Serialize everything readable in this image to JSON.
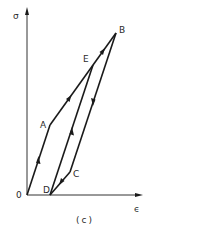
{
  "diagram": {
    "type": "stress-strain hysteresis loop",
    "caption": "(c)",
    "axes": {
      "y_label": "σ",
      "x_label": "ϵ",
      "origin_label": "0"
    },
    "points": [
      {
        "id": "O",
        "label": "0",
        "x": 27,
        "y": 195
      },
      {
        "id": "A",
        "label": "A",
        "x": 50,
        "y": 125
      },
      {
        "id": "E",
        "label": "E",
        "x": 93,
        "y": 65
      },
      {
        "id": "B",
        "label": "B",
        "x": 116,
        "y": 33
      },
      {
        "id": "C",
        "label": "C",
        "x": 70,
        "y": 172
      },
      {
        "id": "D",
        "label": "D",
        "x": 50,
        "y": 195
      }
    ],
    "segments": [
      {
        "from": "O",
        "to": "A",
        "direction": "up"
      },
      {
        "from": "A",
        "to": "B",
        "direction": "up",
        "passes_through": "E"
      },
      {
        "from": "B",
        "to": "C",
        "direction": "down"
      },
      {
        "from": "C",
        "to": "D",
        "direction": "down"
      },
      {
        "from": "D",
        "to": "E",
        "direction": "up"
      }
    ],
    "colors": {
      "line": "#1a1a1a",
      "axis": "#333333",
      "background": "#ffffff"
    }
  }
}
